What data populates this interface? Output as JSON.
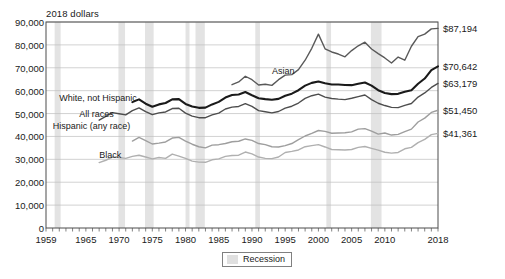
{
  "chart_data": {
    "type": "line",
    "title": "",
    "ylabel": "2018 dollars",
    "xlabel": "",
    "xlim": [
      1959,
      2018
    ],
    "ylim": [
      0,
      90000
    ],
    "grid": true,
    "ytick_labels": [
      "90,000",
      "80,000",
      "70,000",
      "60,000",
      "50,000",
      "40,000",
      "30,000",
      "20,000",
      "10,000",
      "0"
    ],
    "ytick_values": [
      90000,
      80000,
      70000,
      60000,
      50000,
      40000,
      30000,
      20000,
      10000,
      0
    ],
    "xtick_labels": [
      "1959",
      "1965",
      "1970",
      "1975",
      "1980",
      "1985",
      "1990",
      "1995",
      "2000",
      "2005",
      "2010",
      "2018"
    ],
    "xtick_values": [
      1959,
      1965,
      1970,
      1975,
      1980,
      1985,
      1990,
      1995,
      2000,
      2005,
      2010,
      2018
    ],
    "legend": {
      "position": "bottom-center",
      "entries": [
        {
          "label": "Recession",
          "color": "#e0e0e0",
          "type": "band"
        }
      ]
    },
    "end_value_labels": [
      {
        "text": "$87,194",
        "value": 87194,
        "series": "Asian"
      },
      {
        "text": "$70,642",
        "value": 70642,
        "series": "White, not Hispanic"
      },
      {
        "text": "$63,179",
        "value": 63179,
        "series": "All races"
      },
      {
        "text": "$51,450",
        "value": 51450,
        "series": "Hispanic (any race)"
      },
      {
        "text": "$41,361",
        "value": 41361,
        "series": "Black"
      }
    ],
    "annotations": [
      {
        "text": "Asian",
        "x": 1993,
        "y": 68000
      },
      {
        "text": "White, not Hispanic",
        "x": 1961,
        "y": 56400
      },
      {
        "text": "All races",
        "x": 1964,
        "y": 49200
      },
      {
        "text": "Hispanic (any race)",
        "x": 1960,
        "y": 44000
      },
      {
        "text": "Black",
        "x": 1967,
        "y": 31500
      }
    ],
    "recession_bands": [
      {
        "start": 1960.3,
        "end": 1961.2
      },
      {
        "start": 1969.9,
        "end": 1970.9
      },
      {
        "start": 1973.9,
        "end": 1975.2
      },
      {
        "start": 1980.0,
        "end": 1980.6
      },
      {
        "start": 1981.5,
        "end": 1982.9
      },
      {
        "start": 1990.5,
        "end": 1991.2
      },
      {
        "start": 2001.2,
        "end": 2001.9
      },
      {
        "start": 2007.9,
        "end": 2009.5
      }
    ],
    "series": [
      {
        "name": "Asian",
        "color": "#595959",
        "width": 1.4,
        "x": [
          1987,
          1988,
          1989,
          1990,
          1991,
          1992,
          1993,
          1994,
          1995,
          1996,
          1997,
          1998,
          1999,
          2000,
          2001,
          2002,
          2003,
          2004,
          2005,
          2006,
          2007,
          2008,
          2009,
          2010,
          2011,
          2012,
          2013,
          2014,
          2015,
          2016,
          2017,
          2018
        ],
        "values": [
          62600,
          63800,
          66300,
          64800,
          62500,
          62800,
          62300,
          64800,
          66800,
          67000,
          69200,
          73300,
          78500,
          84700,
          78300,
          76900,
          76000,
          74800,
          77500,
          79600,
          81200,
          78200,
          76200,
          74300,
          72100,
          74700,
          73300,
          79400,
          83600,
          84700,
          87000,
          87194
        ]
      },
      {
        "name": "White, not Hispanic",
        "color": "#1a1a1a",
        "width": 2.1,
        "x": [
          1972,
          1973,
          1974,
          1975,
          1976,
          1977,
          1978,
          1979,
          1980,
          1981,
          1982,
          1983,
          1984,
          1985,
          1986,
          1987,
          1988,
          1989,
          1990,
          1991,
          1992,
          1993,
          1994,
          1995,
          1996,
          1997,
          1998,
          1999,
          2000,
          2001,
          2002,
          2003,
          2004,
          2005,
          2006,
          2007,
          2008,
          2009,
          2010,
          2011,
          2012,
          2013,
          2014,
          2015,
          2016,
          2017,
          2018
        ],
        "values": [
          55000,
          56200,
          54300,
          53000,
          54000,
          54600,
          56200,
          56300,
          54200,
          53100,
          52500,
          52600,
          54000,
          55100,
          57000,
          58100,
          58300,
          59400,
          58000,
          56700,
          56300,
          56000,
          56400,
          57800,
          58700,
          60200,
          62200,
          63400,
          64000,
          63200,
          62700,
          62700,
          62500,
          62400,
          63000,
          63600,
          62200,
          60200,
          59000,
          58500,
          58600,
          59500,
          60200,
          63000,
          65300,
          69000,
          70642
        ]
      },
      {
        "name": "All races",
        "color": "#4d4d4d",
        "width": 1.4,
        "x": [
          1967,
          1968,
          1969,
          1970,
          1971,
          1972,
          1973,
          1974,
          1975,
          1976,
          1977,
          1978,
          1979,
          1980,
          1981,
          1982,
          1983,
          1984,
          1985,
          1986,
          1987,
          1988,
          1989,
          1990,
          1991,
          1992,
          1993,
          1994,
          1995,
          1996,
          1997,
          1998,
          1999,
          2000,
          2001,
          2002,
          2003,
          2004,
          2005,
          2006,
          2007,
          2008,
          2009,
          2010,
          2011,
          2012,
          2013,
          2014,
          2015,
          2016,
          2017,
          2018
        ],
        "values": [
          47100,
          48800,
          50400,
          49900,
          49400,
          51300,
          52500,
          50800,
          49500,
          50300,
          50700,
          52200,
          52300,
          50200,
          48900,
          48200,
          48200,
          49400,
          50200,
          52000,
          52800,
          53100,
          54300,
          53100,
          51300,
          50800,
          50300,
          50900,
          52400,
          53200,
          54600,
          56600,
          57800,
          58500,
          57200,
          56600,
          56300,
          56100,
          56700,
          57400,
          58100,
          56100,
          54500,
          53500,
          52700,
          52600,
          53600,
          54400,
          57200,
          59000,
          61400,
          63179
        ]
      },
      {
        "name": "Hispanic (any race)",
        "color": "#9e9e9e",
        "width": 1.4,
        "x": [
          1972,
          1973,
          1974,
          1975,
          1976,
          1977,
          1978,
          1979,
          1980,
          1981,
          1982,
          1983,
          1984,
          1985,
          1986,
          1987,
          1988,
          1989,
          1990,
          1991,
          1992,
          1993,
          1994,
          1995,
          1996,
          1997,
          1998,
          1999,
          2000,
          2001,
          2002,
          2003,
          2004,
          2005,
          2006,
          2007,
          2008,
          2009,
          2010,
          2011,
          2012,
          2013,
          2014,
          2015,
          2016,
          2017,
          2018
        ],
        "values": [
          38000,
          39600,
          38200,
          36700,
          37100,
          37600,
          39300,
          39600,
          38000,
          36600,
          35500,
          35000,
          36200,
          36400,
          36900,
          37700,
          37900,
          38900,
          38300,
          36900,
          36400,
          35500,
          35400,
          36000,
          36900,
          38600,
          40200,
          41300,
          42600,
          42200,
          41400,
          41500,
          41600,
          42000,
          43200,
          43400,
          42300,
          41000,
          41500,
          40600,
          40900,
          42100,
          43200,
          46300,
          48000,
          50500,
          51450
        ]
      },
      {
        "name": "Black",
        "color": "#b0b0b0",
        "width": 1.4,
        "x": [
          1967,
          1968,
          1969,
          1970,
          1971,
          1972,
          1973,
          1974,
          1975,
          1976,
          1977,
          1978,
          1979,
          1980,
          1981,
          1982,
          1983,
          1984,
          1985,
          1986,
          1987,
          1988,
          1989,
          1990,
          1991,
          1992,
          1993,
          1994,
          1995,
          1996,
          1997,
          1998,
          1999,
          2000,
          2001,
          2002,
          2003,
          2004,
          2005,
          2006,
          2007,
          2008,
          2009,
          2010,
          2011,
          2012,
          2013,
          2014,
          2015,
          2016,
          2017,
          2018
        ],
        "values": [
          28600,
          29600,
          31000,
          30800,
          30400,
          31300,
          31800,
          31000,
          30200,
          30800,
          30400,
          32300,
          31400,
          30400,
          29200,
          28800,
          28700,
          29800,
          30200,
          31300,
          31700,
          31800,
          33200,
          32400,
          31000,
          30400,
          30300,
          31000,
          33000,
          33500,
          34100,
          35500,
          36000,
          36400,
          35400,
          34300,
          34200,
          34100,
          34300,
          35200,
          35600,
          34800,
          34000,
          33100,
          32700,
          33000,
          34600,
          35200,
          37300,
          38700,
          40800,
          41361
        ]
      }
    ]
  }
}
